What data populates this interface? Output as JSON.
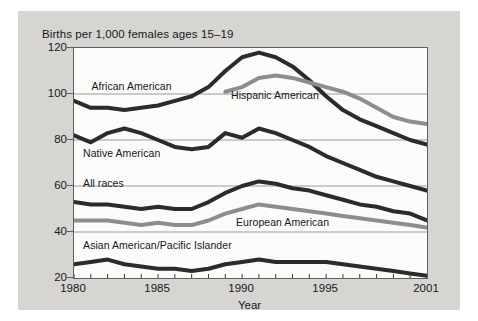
{
  "chart_data": {
    "type": "line",
    "title": "Births per 1,000 females ages 15–19",
    "xlabel": "Year",
    "ylabel": "",
    "xlim": [
      1980,
      2001
    ],
    "ylim": [
      20,
      120
    ],
    "grid": true,
    "gridlines_y": [
      40,
      60,
      80,
      100
    ],
    "yticks": [
      20,
      40,
      60,
      80,
      100,
      120
    ],
    "xticks": [
      1980,
      1985,
      1990,
      1995,
      2001
    ],
    "xtick_labels": [
      "1980",
      "1985",
      "1990",
      "1995",
      "2001"
    ],
    "ytick_labels": [
      "20",
      "40",
      "60",
      "80",
      "100",
      "120"
    ],
    "x": [
      1980,
      1981,
      1982,
      1983,
      1984,
      1985,
      1986,
      1987,
      1988,
      1989,
      1990,
      1991,
      1992,
      1993,
      1994,
      1995,
      1996,
      1997,
      1998,
      1999,
      2000,
      2001
    ],
    "legend_position": "inline-labels",
    "series": [
      {
        "name": "African American",
        "color": "#2b2b2b",
        "label_x_year": 1981.1,
        "label_y_value": 103,
        "values": [
          97,
          94,
          94,
          93,
          94,
          95,
          97,
          99,
          103,
          110,
          116,
          118,
          116,
          112,
          106,
          99,
          93,
          89,
          86,
          83,
          80,
          78
        ]
      },
      {
        "name": "Hispanic American",
        "color": "#8d8d8d",
        "label_x_year": 1989.4,
        "label_y_value": 99,
        "values": [
          null,
          null,
          null,
          null,
          null,
          null,
          null,
          null,
          null,
          101,
          103,
          107,
          108,
          107,
          105,
          103,
          101,
          98,
          94,
          90,
          88,
          87
        ]
      },
      {
        "name": "Native American",
        "color": "#2b2b2b",
        "label_x_year": 1980.6,
        "label_y_value": 74,
        "values": [
          82,
          79,
          83,
          85,
          83,
          80,
          77,
          76,
          77,
          83,
          81,
          85,
          83,
          80,
          77,
          73,
          70,
          67,
          64,
          62,
          60,
          58
        ]
      },
      {
        "name": "All races",
        "color": "#2b2b2b",
        "label_x_year": 1980.6,
        "label_y_value": 61,
        "values": [
          53,
          52,
          52,
          51,
          50,
          51,
          50,
          50,
          53,
          57,
          60,
          62,
          61,
          59,
          58,
          56,
          54,
          52,
          51,
          49,
          48,
          45
        ]
      },
      {
        "name": "European American",
        "color": "#8d8d8d",
        "label_x_year": 1989.7,
        "label_y_value": 44,
        "values": [
          45,
          45,
          45,
          44,
          43,
          44,
          43,
          43,
          45,
          48,
          50,
          52,
          51,
          50,
          49,
          48,
          47,
          46,
          45,
          44,
          43,
          42
        ]
      },
      {
        "name": "Asian American/Pacific Islander",
        "color": "#2b2b2b",
        "label_x_year": 1980.6,
        "label_y_value": 34,
        "values": [
          26,
          27,
          28,
          26,
          25,
          24,
          24,
          23,
          24,
          26,
          27,
          28,
          27,
          27,
          27,
          27,
          26,
          25,
          24,
          23,
          22,
          21
        ]
      }
    ]
  }
}
